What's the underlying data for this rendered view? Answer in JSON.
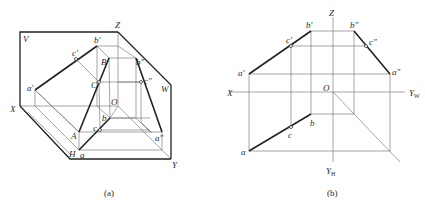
{
  "figure_a": {
    "caption": "(a)",
    "planes": {
      "V": "V",
      "W": "W",
      "H": "H"
    },
    "axes": {
      "X": "X",
      "Y": "Y",
      "Z": "Z",
      "O": "O"
    },
    "space_points": {
      "A": "A",
      "B": "B",
      "C": "C"
    },
    "projections": {
      "a_v": "a′",
      "b_v": "b′",
      "c_v": "c′",
      "a_h": "a",
      "b_h": "b",
      "c_h": "c",
      "a_w": "a″",
      "b_w": "b″",
      "c_w": "c″"
    }
  },
  "figure_b": {
    "caption": "(b)",
    "axes": {
      "X": "X",
      "Z": "Z",
      "O": "O",
      "Y_W": "Y",
      "Y_W_sub": "W",
      "Y_H": "Y",
      "Y_H_sub": "H"
    },
    "projections": {
      "a_v": "a′",
      "b_v": "b′",
      "c_v": "c′",
      "a_h": "a",
      "b_h": "b",
      "c_h": "c",
      "a_w": "a″",
      "b_w": "b″",
      "c_w": "c″"
    }
  }
}
